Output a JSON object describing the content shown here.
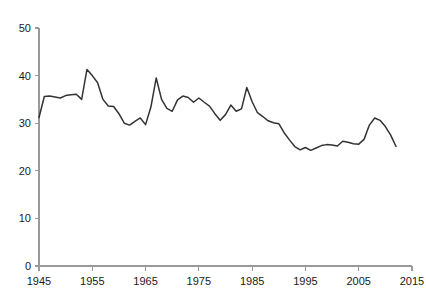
{
  "chart_data": {
    "type": "line",
    "title": "",
    "subtitle": "",
    "xlabel": "",
    "ylabel": "",
    "xlim": [
      1945,
      2015
    ],
    "ylim": [
      0,
      50
    ],
    "grid": false,
    "legend": false,
    "legend_position": "none",
    "line_color": "#333333",
    "axis_color": "#9a9a9a",
    "x_ticks": [
      1945,
      1955,
      1965,
      1975,
      1985,
      1995,
      2005,
      2015
    ],
    "x_tick_labels": [
      "1945",
      "1955",
      "1965",
      "1975",
      "1985",
      "1995",
      "2005",
      "2015"
    ],
    "y_ticks": [
      0,
      10,
      20,
      30,
      40,
      50
    ],
    "y_tick_labels": [
      "0",
      "10",
      "20",
      "30",
      "40",
      "50"
    ],
    "series": [
      {
        "name": "series-1",
        "x": [
          1945,
          1946,
          1947,
          1948,
          1949,
          1950,
          1951,
          1952,
          1953,
          1954,
          1955,
          1956,
          1957,
          1958,
          1959,
          1960,
          1961,
          1962,
          1963,
          1964,
          1965,
          1966,
          1967,
          1968,
          1969,
          1970,
          1971,
          1972,
          1973,
          1974,
          1975,
          1976,
          1977,
          1978,
          1979,
          1980,
          1981,
          1982,
          1983,
          1984,
          1985,
          1986,
          1987,
          1988,
          1989,
          1990,
          1991,
          1992,
          1993,
          1994,
          1995,
          1996,
          1997,
          1998,
          1999,
          2000,
          2001,
          2002,
          2003,
          2004,
          2005,
          2006,
          2007,
          2008,
          2009,
          2010,
          2011,
          2012
        ],
        "values": [
          31.2,
          35.6,
          35.7,
          35.5,
          35.3,
          35.8,
          36.0,
          36.1,
          35.0,
          41.3,
          40.0,
          38.5,
          35.0,
          33.6,
          33.5,
          32.0,
          30.0,
          29.6,
          30.4,
          31.1,
          29.7,
          33.4,
          39.5,
          35.0,
          33.1,
          32.5,
          34.9,
          35.7,
          35.4,
          34.4,
          35.3,
          34.4,
          33.6,
          32.0,
          30.6,
          31.8,
          33.8,
          32.5,
          33.0,
          37.5,
          34.5,
          32.2,
          31.4,
          30.5,
          30.1,
          29.9,
          28.0,
          26.5,
          25.1,
          24.4,
          24.9,
          24.3,
          24.8,
          25.3,
          25.5,
          25.4,
          25.2,
          26.2,
          26.0,
          25.7,
          25.6,
          26.6,
          29.6,
          31.1,
          30.6,
          29.3,
          27.5,
          25.1
        ]
      }
    ]
  },
  "plot_area": {
    "left": 39,
    "right": 412,
    "top": 28,
    "bottom": 266
  }
}
